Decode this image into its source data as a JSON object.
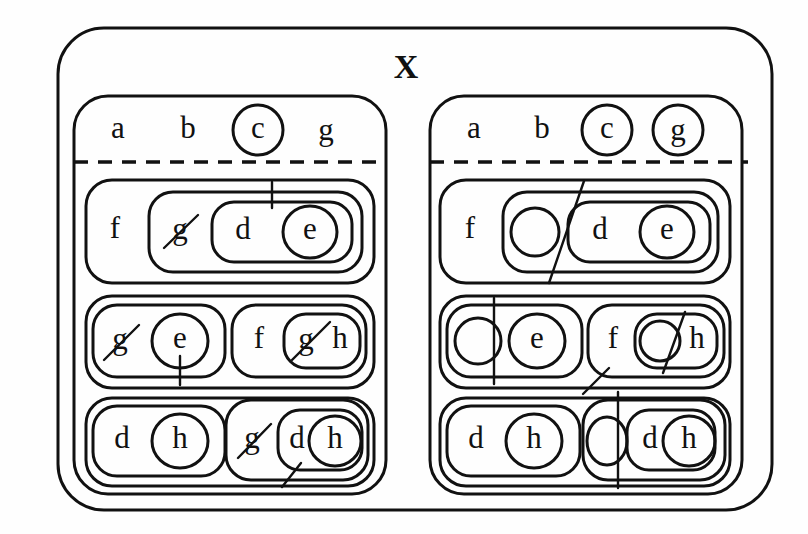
{
  "diagram": {
    "title": "X",
    "type": "nested-set-euler-diagram",
    "universe_label": "X",
    "panels": [
      {
        "id": "left",
        "name": "left-panel",
        "header_row": {
          "items": [
            {
              "label": "a",
              "circled": false
            },
            {
              "label": "b",
              "circled": false
            },
            {
              "label": "c",
              "circled": true
            },
            {
              "label": "g",
              "circled": false
            }
          ]
        },
        "rows": [
          {
            "id": "left-row-1",
            "groups": [
              {
                "id": "left-row1-group1",
                "outer_labels": [
                  "f"
                ],
                "inner": {
                  "labels": [
                    {
                      "label": "g",
                      "struck": true
                    }
                  ],
                  "nested": {
                    "labels": [
                      {
                        "label": "d",
                        "circled": false
                      },
                      {
                        "label": "e",
                        "circled": true
                      }
                    ]
                  }
                },
                "marks": [
                  "vertical-tick-above-d"
                ]
              }
            ]
          },
          {
            "id": "left-row-2",
            "groups": [
              {
                "id": "left-row2-group1",
                "labels": [
                  {
                    "label": "g",
                    "struck": true
                  },
                  {
                    "label": "e",
                    "circled": true
                  }
                ],
                "marks": [
                  "vertical-tick-below-e"
                ]
              },
              {
                "id": "left-row2-group2",
                "outer_labels": [
                  "f"
                ],
                "inner": {
                  "labels": [
                    {
                      "label": "g",
                      "struck": true
                    },
                    {
                      "label": "h",
                      "circled": false
                    }
                  ]
                }
              }
            ]
          },
          {
            "id": "left-row-3",
            "groups": [
              {
                "id": "left-row3-group1",
                "labels": [
                  {
                    "label": "d",
                    "circled": false
                  },
                  {
                    "label": "h",
                    "circled": true
                  }
                ]
              },
              {
                "id": "left-row3-group2",
                "outer_labels": [
                  {
                    "label": "g",
                    "struck": true
                  }
                ],
                "inner": {
                  "labels": [
                    {
                      "label": "d",
                      "circled": false
                    },
                    {
                      "label": "h",
                      "circled": true
                    }
                  ]
                },
                "marks": [
                  "diagonal-tick-below-inner"
                ]
              }
            ]
          }
        ]
      },
      {
        "id": "right",
        "name": "right-panel",
        "header_row": {
          "items": [
            {
              "label": "a",
              "circled": false
            },
            {
              "label": "b",
              "circled": false
            },
            {
              "label": "c",
              "circled": true
            },
            {
              "label": "g",
              "circled": true
            }
          ]
        },
        "rows": [
          {
            "id": "right-row-1",
            "groups": [
              {
                "id": "right-row1-group1",
                "outer_labels": [
                  "f"
                ],
                "inner": {
                  "labels": [
                    {
                      "label": "",
                      "circled": true,
                      "empty": true
                    }
                  ],
                  "nested": {
                    "labels": [
                      {
                        "label": "d",
                        "circled": false
                      },
                      {
                        "label": "e",
                        "circled": true
                      }
                    ]
                  }
                },
                "marks": [
                  "long-diagonal-slash"
                ]
              }
            ]
          },
          {
            "id": "right-row-2",
            "groups": [
              {
                "id": "right-row2-group1",
                "labels": [
                  {
                    "label": "",
                    "circled": true,
                    "empty": true
                  },
                  {
                    "label": "e",
                    "circled": true
                  }
                ],
                "marks": [
                  "vertical-line"
                ]
              },
              {
                "id": "right-row2-group2",
                "outer_labels": [
                  "f"
                ],
                "inner": {
                  "labels": [
                    {
                      "label": "",
                      "circled": true,
                      "empty": true
                    },
                    {
                      "label": "h",
                      "circled": false
                    }
                  ]
                },
                "marks": [
                  "diagonal-slash",
                  "diagonal-tick-lower-left"
                ]
              }
            ]
          },
          {
            "id": "right-row-3",
            "groups": [
              {
                "id": "right-row3-group1",
                "labels": [
                  {
                    "label": "d",
                    "circled": false
                  },
                  {
                    "label": "h",
                    "circled": true
                  }
                ]
              },
              {
                "id": "right-row3-group2",
                "outer_labels": [
                  {
                    "label": "",
                    "circled": true,
                    "empty": true
                  }
                ],
                "inner": {
                  "labels": [
                    {
                      "label": "d",
                      "circled": false
                    },
                    {
                      "label": "h",
                      "circled": true
                    }
                  ]
                },
                "marks": [
                  "vertical-line"
                ]
              }
            ]
          }
        ]
      }
    ],
    "labels": {
      "a": "a",
      "b": "b",
      "c": "c",
      "d": "d",
      "e": "e",
      "f": "f",
      "g": "g",
      "h": "h",
      "x": "X"
    },
    "colors": {
      "stroke": "#111111",
      "background": "#fefefe"
    }
  }
}
